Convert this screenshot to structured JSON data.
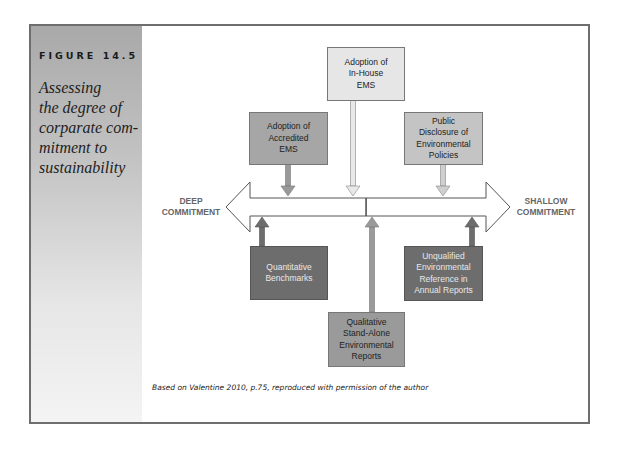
{
  "figure": {
    "label": "FIGURE 14.5",
    "title_lines": [
      "Assessing",
      "the degree of",
      "corparate com-",
      "mitment to",
      "sustainability"
    ],
    "caption": "Based on Valentine 2010, p.75, reproduced with permission of the author"
  },
  "diagram": {
    "left_end": {
      "line1": "DEEP",
      "line2": "COMMITMENT"
    },
    "right_end": {
      "line1": "SHALLOW",
      "line2": "COMMITMENT"
    },
    "top_boxes": [
      {
        "lines": [
          "Adoption of",
          "In-House",
          "EMS"
        ],
        "shade": "light"
      },
      {
        "lines": [
          "Adoption of",
          "Accredited",
          "EMS"
        ],
        "shade": "mid"
      },
      {
        "lines": [
          "Public",
          "Disclosure of",
          "Environmental",
          "Policies"
        ],
        "shade": "mid-light"
      }
    ],
    "bottom_boxes": [
      {
        "lines": [
          "Quantitative",
          "Benchmarks"
        ],
        "shade": "dark"
      },
      {
        "lines": [
          "Qualitative",
          "Stand-Alone",
          "Environmental",
          "Reports"
        ],
        "shade": "mid"
      },
      {
        "lines": [
          "Unqualified",
          "Environmental",
          "Reference in",
          "Annual Reports"
        ],
        "shade": "dark"
      }
    ]
  },
  "colors": {
    "frame_border": "#6e6e6e",
    "box_light": "#e6e6e6",
    "box_mid": "#a6a6a6",
    "box_dark": "#6d6d6d",
    "end_label": "#666666"
  }
}
